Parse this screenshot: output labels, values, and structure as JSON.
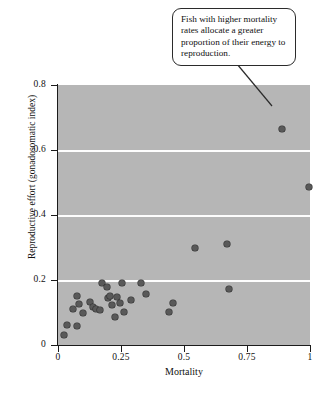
{
  "figure": {
    "background_color": "#ffffff",
    "plot_background_color": "#b6b6b6",
    "gridline_color": "#fdfdfd",
    "marker_color": "#595959",
    "marker_edge_color": "#2e2e2e",
    "axis_color": "#1b1b1b"
  },
  "callout": {
    "text": "Fish with higher mortality rates allocate a greater proportion of their energy to reproduction.",
    "pointer_target": "high-mortality-high-effort-point"
  },
  "caption": {
    "text": ""
  },
  "chart_data": {
    "type": "scatter",
    "title": "",
    "xlabel": "Mortality",
    "ylabel": "Reproductive effort (gonadosomatic index)",
    "xlim": [
      0,
      1
    ],
    "ylim": [
      0,
      0.8
    ],
    "xticks": [
      0,
      0.25,
      0.5,
      0.75,
      1
    ],
    "xtick_labels": [
      "0",
      "0.25",
      "0.5",
      "0.75",
      "1"
    ],
    "yticks": [
      0,
      0.2,
      0.4,
      0.6,
      0.8
    ],
    "ytick_labels": [
      "0",
      "0.2",
      "0.4",
      "0.6",
      "0.8"
    ],
    "grid": true,
    "gridlines_y": [
      0.2,
      0.4,
      0.6
    ],
    "legend": null,
    "series": [
      {
        "name": "Fish species",
        "points": [
          {
            "x": 0.025,
            "y": 0.03
          },
          {
            "x": 0.035,
            "y": 0.062
          },
          {
            "x": 0.075,
            "y": 0.06
          },
          {
            "x": 0.06,
            "y": 0.112
          },
          {
            "x": 0.075,
            "y": 0.152
          },
          {
            "x": 0.085,
            "y": 0.125
          },
          {
            "x": 0.1,
            "y": 0.097
          },
          {
            "x": 0.125,
            "y": 0.132
          },
          {
            "x": 0.14,
            "y": 0.118
          },
          {
            "x": 0.15,
            "y": 0.112
          },
          {
            "x": 0.165,
            "y": 0.108
          },
          {
            "x": 0.175,
            "y": 0.19
          },
          {
            "x": 0.195,
            "y": 0.178
          },
          {
            "x": 0.2,
            "y": 0.145
          },
          {
            "x": 0.205,
            "y": 0.15
          },
          {
            "x": 0.215,
            "y": 0.122
          },
          {
            "x": 0.225,
            "y": 0.085
          },
          {
            "x": 0.235,
            "y": 0.148
          },
          {
            "x": 0.245,
            "y": 0.128
          },
          {
            "x": 0.255,
            "y": 0.19
          },
          {
            "x": 0.26,
            "y": 0.103
          },
          {
            "x": 0.29,
            "y": 0.14
          },
          {
            "x": 0.33,
            "y": 0.19
          },
          {
            "x": 0.35,
            "y": 0.157
          },
          {
            "x": 0.44,
            "y": 0.103
          },
          {
            "x": 0.455,
            "y": 0.128
          },
          {
            "x": 0.545,
            "y": 0.3
          },
          {
            "x": 0.67,
            "y": 0.312
          },
          {
            "x": 0.68,
            "y": 0.172
          },
          {
            "x": 0.89,
            "y": 0.665
          },
          {
            "x": 0.995,
            "y": 0.487
          }
        ]
      }
    ]
  }
}
